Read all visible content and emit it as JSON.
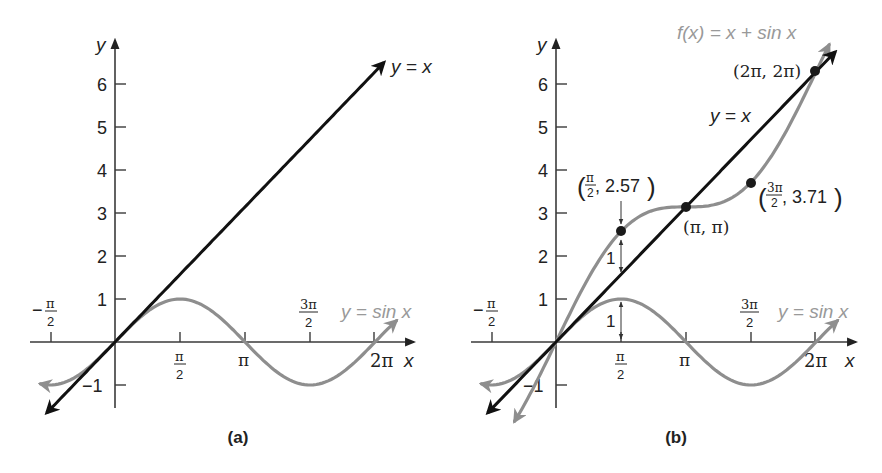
{
  "chart_data": [
    {
      "panel": "a",
      "type": "line",
      "caption": "(a)",
      "xlabel": "x",
      "ylabel": "y",
      "x_ticks": [
        "-π/2",
        "π/2",
        "π",
        "3π/2",
        "2π"
      ],
      "x_tick_values": [
        -1.5708,
        1.5708,
        3.1416,
        4.7124,
        6.2832
      ],
      "y_ticks": [
        "-1",
        "1",
        "2",
        "3",
        "4",
        "5",
        "6"
      ],
      "y_tick_values": [
        -1,
        1,
        2,
        3,
        4,
        5,
        6
      ],
      "series": [
        {
          "name": "y = x",
          "color": "#111111",
          "expr": "x",
          "x_range": [
            -1.65,
            6.5
          ]
        },
        {
          "name": "y = sin x",
          "color": "#8e8e8e",
          "expr": "sin(x)",
          "x_range": [
            -1.8,
            6.8
          ]
        }
      ],
      "labels": {
        "line": "y = x",
        "sine": "y = sin x"
      }
    },
    {
      "panel": "b",
      "type": "line",
      "caption": "(b)",
      "xlabel": "x",
      "ylabel": "y",
      "x_ticks": [
        "-π/2",
        "π/2",
        "π",
        "3π/2",
        "2π"
      ],
      "x_tick_values": [
        -1.5708,
        1.5708,
        3.1416,
        4.7124,
        6.2832
      ],
      "y_ticks": [
        "-1",
        "1",
        "2",
        "3",
        "4",
        "5",
        "6"
      ],
      "y_tick_values": [
        -1,
        1,
        2,
        3,
        4,
        5,
        6
      ],
      "series": [
        {
          "name": "y = x",
          "color": "#111111",
          "expr": "x",
          "x_range": [
            -1.65,
            6.75
          ]
        },
        {
          "name": "y = sin x",
          "color": "#8e8e8e",
          "expr": "sin(x)",
          "x_range": [
            -1.8,
            6.8
          ]
        },
        {
          "name": "f(x) = x + sin x",
          "color": "#8e8e8e",
          "expr": "x+sin(x)",
          "x_range": [
            -1.0,
            6.6
          ]
        }
      ],
      "points": [
        {
          "x": 1.5708,
          "y": 2.57,
          "label_x": "π/2",
          "label_y": "2.57"
        },
        {
          "x": 3.1416,
          "y": 3.1416,
          "label": "(π, π)"
        },
        {
          "x": 4.7124,
          "y": 3.71,
          "label_x": "3π/2",
          "label_y": "3.71"
        },
        {
          "x": 6.2832,
          "y": 6.2832,
          "label": "(2π, 2π)"
        }
      ],
      "annotations": [
        {
          "text": "1",
          "desc": "vertical gap between y = x + sin x and y = x at x = π/2"
        },
        {
          "text": "1",
          "desc": "height of sin x at x = π/2"
        }
      ],
      "labels": {
        "line": "y = x",
        "sine": "y = sin x",
        "sum": "f(x) = x + sin x"
      }
    }
  ],
  "labels": {
    "a": {
      "caption": "(a)",
      "x_axis": "x",
      "y_axis": "y",
      "y_ticks": [
        "6",
        "5",
        "4",
        "3",
        "2",
        "1",
        "−1"
      ],
      "neg_pi_2_num": "π",
      "neg_pi_2_den": "2",
      "neg_sign": "−",
      "pi_2_num": "π",
      "pi_2_den": "2",
      "pi": "π",
      "three_pi_2_num": "3π",
      "three_pi_2_den": "2",
      "two_pi": "2π",
      "line_label": "y = x",
      "sine_label": "y = sin x"
    },
    "b": {
      "caption": "(b)",
      "x_axis": "x",
      "y_axis": "y",
      "y_ticks": [
        "6",
        "5",
        "4",
        "3",
        "2",
        "1",
        "−1"
      ],
      "neg_pi_2_num": "π",
      "neg_pi_2_den": "2",
      "neg_sign": "−",
      "pi_2_num": "π",
      "pi_2_den": "2",
      "pi": "π",
      "three_pi_2_num": "3π",
      "three_pi_2_den": "2",
      "two_pi": "2π",
      "line_label": "y = x",
      "sine_label": "y = sin x",
      "sum_label": "f(x) = x + sin x",
      "pt1_open": "(",
      "pt1_num": "π",
      "pt1_den": "2",
      "pt1_rest": ", 2.57",
      "pt1_close": ")",
      "pt2": "(π, π)",
      "pt3_open": "(",
      "pt3_num": "3π",
      "pt3_den": "2",
      "pt3_rest": ", 3.71",
      "pt3_close": ")",
      "pt4": "(2π, 2π)",
      "gap_upper": "1",
      "gap_lower": "1"
    }
  },
  "colors": {
    "line": "#111111",
    "curve": "#8e8e8e",
    "axis": "#3a3a3a"
  }
}
